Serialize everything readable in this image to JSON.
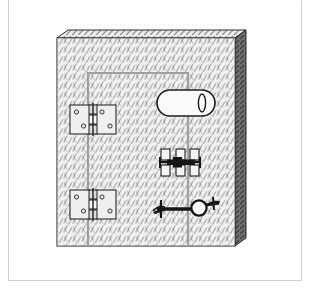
{
  "figure": {
    "background_color": "#ffffff",
    "frame_color": "#cfcfcf",
    "canvas": {
      "width": 310,
      "height": 289
    }
  },
  "door": {
    "name": "metal-door-panel",
    "face": {
      "x": 57,
      "y": 38,
      "width": 178,
      "height": 208,
      "fill_color": "#f2f2f2",
      "outline_color": "#3a3a3a",
      "texture": "diamond-plate-diagonal-hatch",
      "texture_color": "#7d7d7d"
    },
    "right_edge": {
      "name": "door-right-edge-3d",
      "x": 235,
      "y": 30,
      "width": 11,
      "height": 216,
      "fill_color": "#6e6e6e",
      "outline_color": "#2a2a2a"
    },
    "top_edge": {
      "name": "door-top-edge-3d",
      "x": 57,
      "y": 30,
      "width": 189,
      "height": 9,
      "fill_color": "#e9e9e9",
      "outline_color": "#2a2a2a"
    }
  },
  "door_leaf": {
    "name": "inner-door-leaf-outline",
    "x": 88,
    "y": 72,
    "width": 100,
    "height": 174,
    "outline_color": "#8c8c8c",
    "stroke_width": 2
  },
  "hardware": {
    "hinges": [
      {
        "name": "hinge-upper",
        "type": "butt-hinge",
        "x": 70,
        "y": 105,
        "width": 46,
        "height": 29,
        "plate_fill": "#efefef",
        "plate_outline": "#2a2a2a",
        "screw_holes": 4,
        "knuckles": 3,
        "pin_color": "#1e1e1e"
      },
      {
        "name": "hinge-lower",
        "type": "butt-hinge",
        "x": 70,
        "y": 190,
        "width": 46,
        "height": 29,
        "plate_fill": "#efefef",
        "plate_outline": "#2a2a2a",
        "screw_holes": 4,
        "knuckles": 3,
        "pin_color": "#1e1e1e"
      }
    ],
    "pull_handle": {
      "name": "pull-handle-stadium",
      "type": "stadium-pull-handle",
      "x": 157,
      "y": 90,
      "width": 58,
      "height": 26,
      "fill_color": "#fbfbfb",
      "outline_color": "#1e1e1e",
      "keyhole": {
        "name": "handle-keyhole-ellipse",
        "cx": 202,
        "cy": 103,
        "rx": 3.5,
        "ry": 9,
        "fill_color": "#fbfbfb",
        "outline_color": "#1e1e1e"
      }
    },
    "barrel_bolt": {
      "name": "barrel-bolt-assembly",
      "type": "sliding-barrel-bolt",
      "x": 160,
      "y": 149,
      "width": 40,
      "height": 25,
      "bar_color": "#151515",
      "brackets": 3,
      "bracket_fill": "#f4f4f4",
      "bracket_outline": "#1e1e1e",
      "bracket_count_top": 3,
      "bracket_count_bottom": 3
    },
    "lever_latch": {
      "name": "lever-latch-handle",
      "type": "lever-handle-with-knob",
      "x": 153,
      "y": 198,
      "width": 66,
      "height": 24,
      "bar_color": "#151515",
      "knob": {
        "name": "latch-round-knob",
        "cx": 199,
        "cy": 208,
        "r": 7.5,
        "fill_color": "#ffffff",
        "outline_color": "#151515"
      },
      "left_tip": {
        "name": "latch-left-pointer",
        "cx": 159,
        "cy": 209
      },
      "right_tip": {
        "name": "latch-right-pointer",
        "cx": 213,
        "cy": 204
      }
    }
  }
}
